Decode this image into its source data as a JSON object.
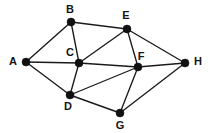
{
  "figure": {
    "type": "node-link-diagram",
    "width": 211,
    "height": 133,
    "background_color": "#ffffff",
    "edge_color": "#1a1a1a",
    "node_color": "#111111",
    "label_color": "#141414",
    "node_radius": 4,
    "edge_width": 1.35
  },
  "graph": {
    "directed": false,
    "weighted": false,
    "node_count": 8,
    "edge_count": 15,
    "nodes": [
      {
        "id": "A",
        "label": "A",
        "x": 26,
        "y": 62,
        "label_x": 13,
        "label_y": 62,
        "label_anchor": "middle"
      },
      {
        "id": "B",
        "label": "B",
        "x": 71,
        "y": 22,
        "label_x": 70,
        "label_y": 10,
        "label_anchor": "middle"
      },
      {
        "id": "C",
        "label": "C",
        "x": 79,
        "y": 63,
        "label_x": 70,
        "label_y": 53,
        "label_anchor": "middle"
      },
      {
        "id": "D",
        "label": "D",
        "x": 70,
        "y": 95,
        "label_x": 68,
        "label_y": 107,
        "label_anchor": "middle"
      },
      {
        "id": "E",
        "label": "E",
        "x": 127,
        "y": 29,
        "label_x": 126,
        "label_y": 16,
        "label_anchor": "middle"
      },
      {
        "id": "F",
        "label": "F",
        "x": 138,
        "y": 67,
        "label_x": 141,
        "label_y": 57,
        "label_anchor": "middle"
      },
      {
        "id": "G",
        "label": "G",
        "x": 120,
        "y": 113,
        "label_x": 120,
        "label_y": 126,
        "label_anchor": "middle"
      },
      {
        "id": "H",
        "label": "H",
        "x": 185,
        "y": 63,
        "label_x": 198,
        "label_y": 62,
        "label_anchor": "middle"
      }
    ],
    "edges": [
      {
        "source": "A",
        "target": "B",
        "x1": 26,
        "y1": 62,
        "x2": 71,
        "y2": 22
      },
      {
        "source": "A",
        "target": "C",
        "x1": 26,
        "y1": 62,
        "x2": 79,
        "y2": 63
      },
      {
        "source": "A",
        "target": "D",
        "x1": 26,
        "y1": 62,
        "x2": 70,
        "y2": 95
      },
      {
        "source": "B",
        "target": "C",
        "x1": 71,
        "y1": 22,
        "x2": 79,
        "y2": 63
      },
      {
        "source": "B",
        "target": "E",
        "x1": 71,
        "y1": 22,
        "x2": 127,
        "y2": 29
      },
      {
        "source": "C",
        "target": "D",
        "x1": 79,
        "y1": 63,
        "x2": 70,
        "y2": 95
      },
      {
        "source": "C",
        "target": "E",
        "x1": 79,
        "y1": 63,
        "x2": 127,
        "y2": 29
      },
      {
        "source": "C",
        "target": "F",
        "x1": 79,
        "y1": 63,
        "x2": 138,
        "y2": 67
      },
      {
        "source": "D",
        "target": "F",
        "x1": 70,
        "y1": 95,
        "x2": 138,
        "y2": 67
      },
      {
        "source": "D",
        "target": "G",
        "x1": 70,
        "y1": 95,
        "x2": 120,
        "y2": 113
      },
      {
        "source": "E",
        "target": "F",
        "x1": 127,
        "y1": 29,
        "x2": 138,
        "y2": 67
      },
      {
        "source": "E",
        "target": "H",
        "x1": 127,
        "y1": 29,
        "x2": 185,
        "y2": 63
      },
      {
        "source": "F",
        "target": "G",
        "x1": 138,
        "y1": 67,
        "x2": 120,
        "y2": 113
      },
      {
        "source": "F",
        "target": "H",
        "x1": 138,
        "y1": 67,
        "x2": 185,
        "y2": 63
      },
      {
        "source": "G",
        "target": "H",
        "x1": 120,
        "y1": 113,
        "x2": 185,
        "y2": 63
      }
    ]
  }
}
